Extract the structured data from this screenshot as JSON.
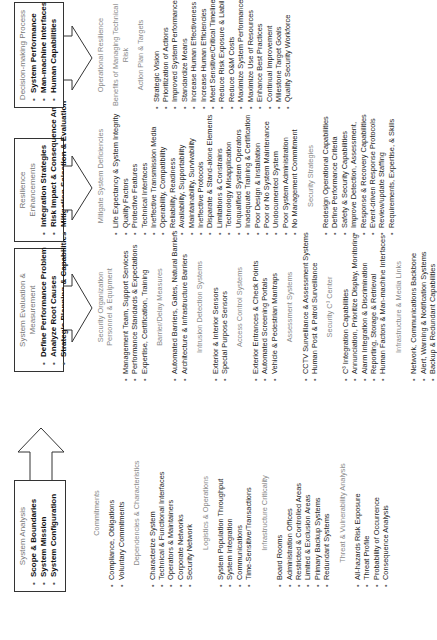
{
  "stages": [
    {
      "title": "System Analysis",
      "items": [
        "Scope & Boundaries",
        "System Mission",
        "System Configuration"
      ]
    },
    {
      "title": "System Evaluation & Measurement",
      "items": [
        "Define Performance Problem",
        "Analyze Root Causes",
        "Strategic Planning & Capabilities"
      ]
    },
    {
      "title": "Resilience Enhancements",
      "items": [
        "Integration Strategies",
        "Risk Impact & Consequence Analysis",
        "Mitigation Selection & Evaluation"
      ]
    },
    {
      "title": "Decision-making Process",
      "items": [
        "System Performance",
        "Man-machine Interfaces",
        "Human Capabilities"
      ]
    }
  ],
  "analysis": {
    "commitments": {
      "heading": "Commitments",
      "items": [
        "Compliance, Obligations",
        "Voluntary Commitments"
      ]
    },
    "dependencies": {
      "heading": "Dependencies & Characteristics",
      "items": [
        "Characterize System",
        "Technical & Functional Interfaces",
        "Operators & Maintainers",
        "Corporate Networks",
        "Security Network"
      ]
    },
    "logistics": {
      "heading": "Logistics & Operations",
      "items": [
        "System Population Throughput",
        "System Integration",
        "Communications",
        "Time-Sensitive/Transactions"
      ]
    },
    "criticality": {
      "heading": "Infrastructure Criticality",
      "items": [
        "Board Rooms",
        "Administration Offices",
        "Restricted & Controlled Areas",
        "Limited & Exclusion Areas",
        "Primary Backup Systems",
        "Redundant Systems"
      ]
    },
    "threat": {
      "heading": "Threat & Vulnerability Analysis",
      "items": [
        "All-hazards Risk Exposure",
        "Threat Profile",
        "Probability of Occurrence",
        "Consequence Analysis"
      ]
    }
  },
  "evaluation": {
    "org": {
      "heading": "Security Organization",
      "subheading": "Personnel & Equipment",
      "items": [
        "Management Team, Support Services",
        "Performance Standards & Expectations",
        "Expertise, Certification, Training"
      ]
    },
    "barrier": {
      "heading": "Barrier/Delay Measures",
      "items": [
        "Automated Barriers, Gates, Natural Barriers",
        "Architecture & Infrastructure Barriers"
      ]
    },
    "intrusion": {
      "heading": "Intrusion Detection Systems",
      "items": [
        "Exterior & Interior Sensors",
        "Special Purpose Sensors"
      ]
    },
    "access": {
      "heading": "Access Control Systems",
      "items": [
        "Exterior Entrances & Check Points",
        "Automated Screening Portals",
        "Vehicle & Pedestrian Mantraps"
      ]
    },
    "assessment": {
      "heading": "Assessment Systems",
      "items": [
        "CCTV Surveillance & Assessment Systems",
        "Human Post & Patrol Surveillance"
      ]
    },
    "c3": {
      "heading": "Security C³ Center",
      "items": [
        "C³ Integration Capabilities",
        "Annunciation, Prioritize Display, Monitoring",
        "Alarm Integration & Discrimination",
        "Reporting, Storage & Retrieval",
        "Human Factors & Man-machine Interfaces"
      ]
    },
    "media": {
      "heading": "Infrastructure & Media Links",
      "items": [
        "Network, Communications Backbone",
        "Alert, Warning & Notification Systems",
        "Backup & Redundant Capabilities"
      ]
    }
  },
  "resilience": {
    "deficiencies": {
      "heading": "Mitigate System Deficiencies",
      "items": [
        "Life Expectancy & System Integrity",
        "Quality Factors",
        "Protective Features",
        "Technical Interfaces",
        "Ineffective Transmission Media",
        "Operability, Compatibility",
        "Reliability, Readiness",
        "Availability, Supportability",
        "Maintainability, Survivability",
        "Ineffective Protocols",
        "Disparate & Stand-alone Elements",
        "Limitations & Constrains",
        "Technology Misapplication",
        "Unqualified System Operators",
        "Inadequate Training & Certification",
        "Poor Design & Installation",
        "Poor or No System Maintenance",
        "Undocumented System",
        "Poor System Administration",
        "No Management Commitment"
      ]
    },
    "strategies": {
      "heading": "Security Strategies",
      "items": [
        "Redesign Operational Capabilities",
        "Define Performance Criteria",
        "Safety & Security Capabilities",
        "Improve Detection, Assessment,",
        "Response & Recovery Capabilities",
        "Event-driven Response Protocols",
        "Review/update Staffing",
        "Requirements, Expertise, & Skills"
      ]
    }
  },
  "decision": {
    "heading1": "Operational Resilience",
    "heading2": "Benefits of Managing Technical Risk",
    "plan": {
      "heading": "Action Plan & Targets",
      "items": [
        "Strategic Vision",
        "Prioritization of Actions",
        "Improved System Performance",
        "Standardize Means",
        "Increase Human Effectiveness",
        "Increase Human Efficiencies",
        "Meet Sensitive/Critical Timelines",
        "Reduce Risk Exposure & Liability",
        "Reduce O&M Costs",
        "Maximize System Performance",
        "Maximize Use of Resources",
        "Enhance Best Practices",
        "Continual Improvement",
        "Milestone Target Goals",
        "Quality Security Workforce"
      ]
    }
  }
}
